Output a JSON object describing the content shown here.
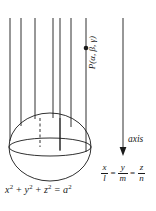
{
  "figure": {
    "background_color": "#ffffff",
    "stroke_color": "#1a1a1a",
    "width": 156,
    "height": 211
  },
  "labels": {
    "point_label": "P(α, β, γ)",
    "axis_label": "axis",
    "sphere_equation_parts": {
      "x": "x",
      "x_exp": "2",
      "plus1": " + ",
      "y": "y",
      "y_exp": "2",
      "plus2": " + ",
      "z": "z",
      "z_exp": "2",
      "equals": " = ",
      "a": "a",
      "a_exp": "2"
    },
    "sphere_equation_plain": "x² + y² + z² = a²",
    "direction_ratios": {
      "f1_num": "x",
      "f1_den": "l",
      "eq1": "=",
      "f2_num": "y",
      "f2_den": "m",
      "eq2": "=",
      "f3_num": "z",
      "f3_den": "n",
      "plain": "x/l = y/m = z/n"
    }
  },
  "geometry": {
    "sphere": {
      "center_x": 50,
      "center_y": 147,
      "radius_x": 41,
      "radius_y": 34,
      "equator_ry": 9,
      "equator_cy": 147
    },
    "parallel_lines_x": [
      10,
      21,
      35,
      40,
      53,
      60,
      71
    ],
    "parallel_lines_top_y": 18,
    "dashed_line": {
      "x": 40,
      "y_top": 118,
      "y_bottom": 147
    },
    "point_marker": {
      "x": 86,
      "y": 48,
      "radius": 2.2
    },
    "point_line": {
      "x": 86,
      "y_top": 18,
      "y_bottom": 152
    },
    "axis_arrow": {
      "x": 123,
      "y_top": 18,
      "y_bottom": 155
    }
  }
}
